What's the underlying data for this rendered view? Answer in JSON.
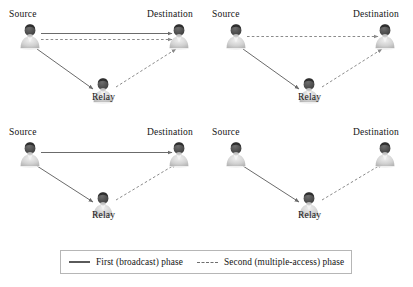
{
  "figure": {
    "width": 413,
    "height": 287,
    "background": "#ffffff"
  },
  "labels": {
    "source": "Source",
    "relay": "Relay",
    "destination": "Destination"
  },
  "legend": {
    "entries": [
      {
        "style": "solid",
        "label": "First (broadcast) phase",
        "color": "#5a5a5a"
      },
      {
        "style": "dashed",
        "label": "Second (multiple-access) phase",
        "color": "#6e6e6e"
      }
    ]
  },
  "panels": [
    {
      "id": "top-left",
      "nodes": {
        "source": {
          "label": "Source",
          "x": 30,
          "y": 38
        },
        "relay": {
          "label": "Relay",
          "x": 103,
          "y": 92
        },
        "destination": {
          "label": "Destination",
          "x": 179,
          "y": 38
        }
      },
      "links": [
        {
          "from": "source",
          "to": "destination",
          "phase": "first",
          "style": "solid"
        },
        {
          "from": "source",
          "to": "destination",
          "phase": "second",
          "style": "dashed"
        },
        {
          "from": "source",
          "to": "relay",
          "phase": "first",
          "style": "solid"
        },
        {
          "from": "relay",
          "to": "destination",
          "phase": "second",
          "style": "dashed"
        }
      ]
    },
    {
      "id": "top-right",
      "nodes": {
        "source": {
          "label": "Source",
          "x": 236,
          "y": 38
        },
        "relay": {
          "label": "Relay",
          "x": 309,
          "y": 92
        },
        "destination": {
          "label": "Destination",
          "x": 385,
          "y": 38
        }
      },
      "links": [
        {
          "from": "source",
          "to": "destination",
          "phase": "second",
          "style": "dashed"
        },
        {
          "from": "source",
          "to": "relay",
          "phase": "first",
          "style": "solid"
        },
        {
          "from": "relay",
          "to": "destination",
          "phase": "second",
          "style": "dashed"
        }
      ]
    },
    {
      "id": "bottom-left",
      "nodes": {
        "source": {
          "label": "Source",
          "x": 30,
          "y": 157
        },
        "relay": {
          "label": "Relay",
          "x": 103,
          "y": 205
        },
        "destination": {
          "label": "Destination",
          "x": 179,
          "y": 157
        }
      },
      "links": [
        {
          "from": "source",
          "to": "destination",
          "phase": "first",
          "style": "solid"
        },
        {
          "from": "source",
          "to": "relay",
          "phase": "first",
          "style": "solid"
        },
        {
          "from": "relay",
          "to": "destination",
          "phase": "second",
          "style": "dashed"
        }
      ]
    },
    {
      "id": "bottom-right",
      "nodes": {
        "source": {
          "label": "Source",
          "x": 236,
          "y": 157
        },
        "relay": {
          "label": "Relay",
          "x": 309,
          "y": 205
        },
        "destination": {
          "label": "Destination",
          "x": 385,
          "y": 157
        }
      },
      "links": [
        {
          "from": "source",
          "to": "relay",
          "phase": "first",
          "style": "solid"
        },
        {
          "from": "relay",
          "to": "destination",
          "phase": "second",
          "style": "dashed"
        }
      ]
    }
  ],
  "colors": {
    "solid_line": "#6b6b6b",
    "dashed_line": "#8a8a8a",
    "text": "#141414",
    "legend_border": "#b6b6b6",
    "person_dark": "#3c3c3c",
    "person_mid": "#9a9a9a",
    "person_light": "#d8d8d8"
  }
}
